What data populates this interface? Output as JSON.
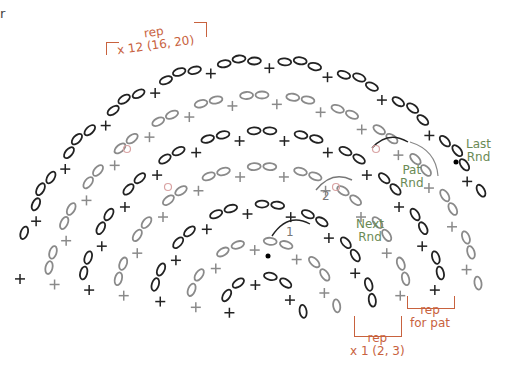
{
  "diagram": {
    "colors": {
      "current_round": "#222222",
      "previous_round": "#8a8a8a",
      "annotation": "#c8623e",
      "round_label": "#6a8a55",
      "marker": "#d9a3a3"
    },
    "stray_text": "r",
    "labels": {
      "rep_top": {
        "line1": "rep",
        "line2": "x 12 (16, 20)"
      },
      "rep_bottom": {
        "line1": "rep",
        "line2": "x 1 (2, 3)"
      },
      "rep_pat": {
        "line1": "rep",
        "line2": "for pat"
      },
      "last_rnd": {
        "line1": "Last",
        "line2": "Rnd"
      },
      "pat_rnd": {
        "line1": "Pat",
        "line2": "Rnd"
      },
      "next_rnd": {
        "line1": "Next",
        "line2": "Rnd"
      },
      "step_1": "1",
      "step_2": "2"
    },
    "symbols": {
      "chain": "oval",
      "single_crochet": "x",
      "start_marker": "filled-dot",
      "slip_marker": "small-circle"
    },
    "layout": {
      "center_x": 262,
      "center_y": 318,
      "rings": [
        {
          "radius": 250,
          "tone": "dark",
          "loops": 6
        },
        {
          "radius": 215,
          "tone": "light",
          "loops": 6
        },
        {
          "radius": 180,
          "tone": "dark",
          "loops": 5
        },
        {
          "radius": 145,
          "tone": "light",
          "loops": 5
        },
        {
          "radius": 108,
          "tone": "dark",
          "loops": 4
        },
        {
          "radius": 72,
          "tone": "light",
          "loops": 3
        },
        {
          "radius": 38,
          "tone": "dark",
          "loops": 2
        }
      ]
    }
  }
}
